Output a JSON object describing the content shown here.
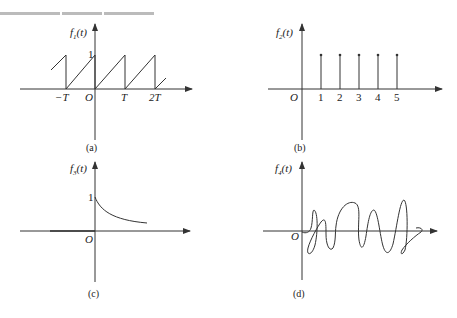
{
  "figure": {
    "panels": [
      {
        "id": "a",
        "caption": "(a)",
        "ylabel_main": "f",
        "ylabel_sub": "1",
        "ylabel_arg": "(t)",
        "origin": "O",
        "y_tick": "1",
        "x_ticks": [
          "−T",
          "T",
          "2T"
        ],
        "description": "periodic sawtooth wave, period T, amplitude 1"
      },
      {
        "id": "b",
        "caption": "(b)",
        "ylabel_main": "f",
        "ylabel_sub": "2",
        "ylabel_arg": "(t)",
        "origin": "O",
        "x_ticks": [
          "1",
          "2",
          "3",
          "4",
          "5"
        ],
        "description": "discrete impulses at t = 1..5"
      },
      {
        "id": "c",
        "caption": "(c)",
        "ylabel_main": "f",
        "ylabel_sub": "3",
        "ylabel_arg": "(t)",
        "origin": "O",
        "y_tick": "1",
        "description": "decaying curve starting at 1 for t ≥ 0"
      },
      {
        "id": "d",
        "caption": "(d)",
        "ylabel_main": "f",
        "ylabel_sub": "4",
        "ylabel_arg": "(t)",
        "origin": "O",
        "description": "irregular random-like waveform"
      }
    ]
  }
}
